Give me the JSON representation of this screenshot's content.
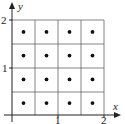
{
  "diagram": {
    "type": "grid-with-midpoints",
    "axes": {
      "x_label": "x",
      "y_label": "y",
      "x_ticks": [
        "1",
        "2"
      ],
      "y_ticks": [
        "1",
        "2"
      ]
    },
    "grid": {
      "rows": 4,
      "cols": 4,
      "x_range": [
        0,
        2
      ],
      "y_range": [
        0,
        2
      ],
      "cell_size": 0.5
    },
    "points": [
      [
        0.25,
        0.25
      ],
      [
        0.75,
        0.25
      ],
      [
        1.25,
        0.25
      ],
      [
        1.75,
        0.25
      ],
      [
        0.25,
        0.75
      ],
      [
        0.75,
        0.75
      ],
      [
        1.25,
        0.75
      ],
      [
        1.75,
        0.75
      ],
      [
        0.25,
        1.25
      ],
      [
        0.75,
        1.25
      ],
      [
        1.25,
        1.25
      ],
      [
        1.75,
        1.25
      ],
      [
        0.25,
        1.75
      ],
      [
        0.75,
        1.75
      ],
      [
        1.25,
        1.75
      ],
      [
        1.75,
        1.75
      ]
    ],
    "colors": {
      "line": "#555555",
      "axis": "#222222",
      "dot": "#111111"
    }
  }
}
